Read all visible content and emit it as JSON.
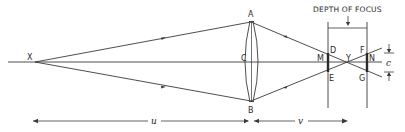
{
  "diagram": {
    "title": "DEPTH OF FOCUS",
    "points": {
      "X": "X",
      "A": "A",
      "B": "B",
      "C": "C",
      "D": "D",
      "E": "E",
      "F": "F",
      "G": "G",
      "M": "M",
      "N": "N",
      "Y": "Y"
    },
    "dimensions": {
      "object_distance": "u",
      "image_distance": "v",
      "blur_circle": "c"
    },
    "colors": {
      "line": "#3a3a3a",
      "background": "#ffffff"
    }
  }
}
